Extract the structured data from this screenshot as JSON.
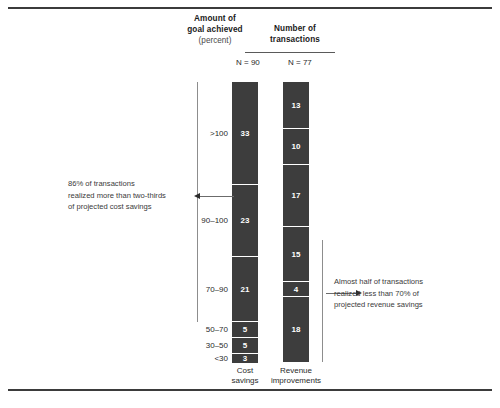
{
  "frame": {
    "rule_top": "top-rule",
    "rule_bottom": "bottom-rule"
  },
  "headers": {
    "left_line1": "Amount of",
    "left_line2": "goal achieved",
    "left_line3": "(percent)",
    "right_line1": "Number of",
    "right_line2": "transactions",
    "n_cost": "N = 90",
    "n_revenue": "N = 77"
  },
  "series_labels": {
    "cost_line1": "Cost",
    "cost_line2": "savings",
    "revenue_line1": "Revenue",
    "revenue_line2": "improvements"
  },
  "notes": {
    "left_l1": "86% of transactions",
    "left_l2": "realized more than two-thirds",
    "left_l3": "of projected cost savings",
    "right_l1": "Almost half of transactions",
    "right_l2": "realized less than 70% of",
    "right_l3": "projected revenue savings"
  },
  "categories": [
    ">100",
    "90–100",
    "70–90",
    "50–70",
    "30–50",
    "<30"
  ],
  "cost": [
    "33",
    "23",
    "21",
    "5",
    "5",
    "3"
  ],
  "revenue": [
    "13",
    "10",
    "17",
    "15",
    "4",
    "18"
  ],
  "colors": {
    "bar": "#3d3d3d",
    "rule": "#3b3b3b",
    "bracket": "#8d8d8d",
    "text": "#2a2a2a",
    "value_text": "#ffffff"
  },
  "chart_data": {
    "type": "bar",
    "subtitle": "",
    "orientation": "vertical-stacked",
    "xlabel": "",
    "ylabel": "Amount of goal achieved (percent)",
    "categories": [
      ">100",
      "90–100",
      "70–90",
      "50–70",
      "30–50",
      "<30"
    ],
    "category_order": "top-to-bottom",
    "series": [
      {
        "name": "Cost savings",
        "n": 90,
        "n_label": "N = 90",
        "values": [
          33,
          23,
          21,
          5,
          5,
          3
        ],
        "data_labels": [
          "33",
          "23",
          "21",
          "5",
          "5",
          "3"
        ]
      },
      {
        "name": "Revenue improvements",
        "n": 77,
        "n_label": "N = 77",
        "values": [
          13,
          10,
          17,
          15,
          4,
          18
        ],
        "data_labels": [
          "13",
          "10",
          "17",
          "15",
          "4",
          "18"
        ]
      }
    ],
    "value_units": "number of transactions",
    "grid": false,
    "legend": "none",
    "annotations": [
      {
        "text": "86% of transactions realized more than two-thirds of projected cost savings",
        "target_series": "Cost savings",
        "covers_categories": [
          ">100",
          "90–100",
          "70–90"
        ],
        "position": "left",
        "value_pct": 86
      },
      {
        "text": "Almost half of transactions realized less than 70% of projected revenue savings",
        "target_series": "Revenue improvements",
        "covers_categories": [
          "50–70",
          "30–50",
          "<30"
        ],
        "position": "right",
        "value_pct": 48
      }
    ]
  }
}
